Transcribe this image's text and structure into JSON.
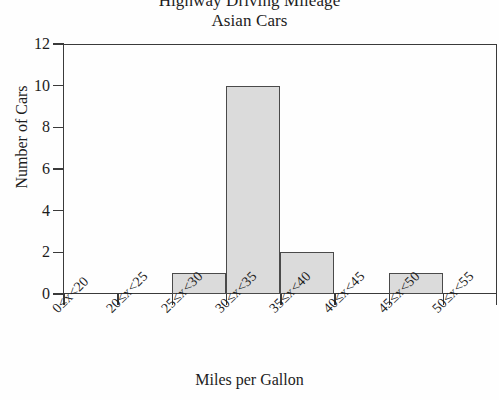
{
  "chart_data": {
    "type": "bar",
    "title": "Highway Driving Mileage",
    "subtitle": "Asian Cars",
    "xlabel": "Miles per Gallon",
    "ylabel": "Number of Cars",
    "categories": [
      "0≤x<20",
      "20≤x<25",
      "25≤x<30",
      "30≤x<35",
      "35≤x<40",
      "40≤x<45",
      "45≤x<50",
      "50≤x<55"
    ],
    "values": [
      0,
      0,
      1,
      10,
      2,
      0,
      1,
      0
    ],
    "ylim": [
      0,
      12
    ],
    "yticks": [
      "0",
      "2",
      "4",
      "6",
      "8",
      "10",
      "12"
    ],
    "ytick_values": [
      0,
      2,
      4,
      6,
      8,
      10,
      12
    ],
    "grid": false,
    "legend": "none",
    "bar_fill_color": "#dbdbdb",
    "bar_edge_color": "#4a4a4a",
    "axis_color": "#3a3a3a",
    "background_color": "#fefefe",
    "xtick_label_rotation_degrees": 45
  }
}
